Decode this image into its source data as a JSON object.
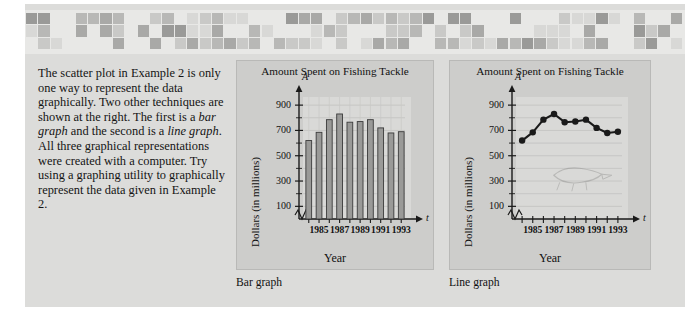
{
  "page": {
    "background_color": "#dcdcda",
    "mosaic_band": {
      "name": "decorative-mosaic-band",
      "rows": 3,
      "colors": [
        "#e8e8e6",
        "#d8d8d6",
        "#c9c9c7",
        "#b8b8b6",
        "#a9a9a7",
        "#9a9a98"
      ]
    }
  },
  "body_text": {
    "paragraph": "The scatter plot in Example 2 is only one way to represent the data graphically. Two other techniques are shown at the right. The first is a bar graph and the second is a line graph. All three graphical representations were created with a computer. Try using a graphing utility to graphically represent the data given in Example 2.",
    "italic_terms": [
      "bar graph",
      "line graph"
    ]
  },
  "captions": {
    "bar": "Bar graph",
    "line": "Line graph"
  },
  "chart_data": [
    {
      "type": "bar",
      "name": "bar-graph",
      "title": "Amount Spent on Fishing Tackle",
      "xlabel": "Year",
      "ylabel": "Dollars (in millions)",
      "x_axis_symbol": "t",
      "y_axis_symbol": "A",
      "categories": [
        1984,
        1985,
        1986,
        1987,
        1988,
        1989,
        1990,
        1991,
        1992,
        1993
      ],
      "values": [
        620,
        685,
        785,
        830,
        765,
        770,
        785,
        720,
        680,
        690
      ],
      "ylim": [
        0,
        980
      ],
      "yticks": [
        100,
        300,
        500,
        700,
        900
      ],
      "ytick_labels": [
        "100",
        "300",
        "500",
        "700",
        "900"
      ],
      "yminor": [
        200,
        400,
        600,
        800
      ],
      "xtick_labels": [
        "1985",
        "1987",
        "1989",
        "1991",
        "1993"
      ],
      "xtick_years": [
        1985,
        1987,
        1989,
        1991,
        1993
      ],
      "grid": true,
      "legend": "none",
      "bar_fill": "#9a9a98",
      "bar_edge": "#3a3a3a",
      "axis_break": true
    },
    {
      "type": "line",
      "name": "line-graph",
      "title": "Amount Spent on Fishing Tackle",
      "xlabel": "Year",
      "ylabel": "Dollars (in millions)",
      "x_axis_symbol": "t",
      "y_axis_symbol": "A",
      "x": [
        1984,
        1985,
        1986,
        1987,
        1988,
        1989,
        1990,
        1991,
        1992,
        1993
      ],
      "values": [
        620,
        685,
        785,
        830,
        765,
        770,
        785,
        720,
        680,
        690
      ],
      "ylim": [
        0,
        980
      ],
      "yticks": [
        100,
        300,
        500,
        700,
        900
      ],
      "ytick_labels": [
        "100",
        "300",
        "500",
        "700",
        "900"
      ],
      "yminor": [
        200,
        400,
        600,
        800
      ],
      "xtick_labels": [
        "1985",
        "1987",
        "1989",
        "1991",
        "1993"
      ],
      "xtick_years": [
        1985,
        1987,
        1989,
        1991,
        1993
      ],
      "grid": true,
      "legend": "none",
      "line_color": "#1a1a1a",
      "marker": "circle",
      "axis_break": true,
      "watermark": "faint-fish-sketch"
    }
  ]
}
